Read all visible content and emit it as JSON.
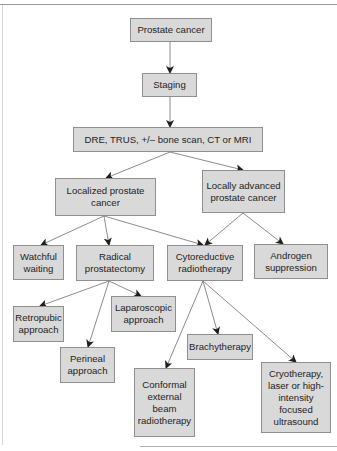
{
  "diagram": {
    "type": "flowchart",
    "fill_color": "#d9d9d9",
    "border_color": "#8f8f8f",
    "edge_color": "#6e6e6e",
    "nodes": {
      "prostate_cancer": "Prostate cancer",
      "staging": "Staging",
      "dre": "DRE, TRUS, +/– bone scan, CT or MRI",
      "localized": "Localized prostate\ncancer",
      "locally_advanced": "Locally advanced\nprostate cancer",
      "watchful": "Watchful\nwaiting",
      "radical": "Radical\nprostatectomy",
      "cytoreductive": "Cytoreductive\nradiotherapy",
      "androgen": "Androgen\nsuppression",
      "retropubic": "Retropubic\napproach",
      "laparoscopic": "Laparoscopic\napproach",
      "perineal": "Perineal\napproach",
      "brachytherapy": "Brachytherapy",
      "conformal": "Conformal\nexternal\nbeam\nradiotherapy",
      "cryotherapy": "Cryotherapy,\nlaser or high-\nintensity\nfocused\nultrasound"
    },
    "edges": [
      [
        "prostate_cancer",
        "staging"
      ],
      [
        "staging",
        "dre"
      ],
      [
        "dre",
        "localized"
      ],
      [
        "dre",
        "locally_advanced"
      ],
      [
        "localized",
        "watchful"
      ],
      [
        "localized",
        "radical"
      ],
      [
        "localized",
        "cytoreductive"
      ],
      [
        "locally_advanced",
        "cytoreductive"
      ],
      [
        "locally_advanced",
        "androgen"
      ],
      [
        "radical",
        "retropubic"
      ],
      [
        "radical",
        "perineal"
      ],
      [
        "radical",
        "laparoscopic"
      ],
      [
        "cytoreductive",
        "conformal"
      ],
      [
        "cytoreductive",
        "brachytherapy"
      ],
      [
        "cytoreductive",
        "cryotherapy"
      ]
    ]
  }
}
